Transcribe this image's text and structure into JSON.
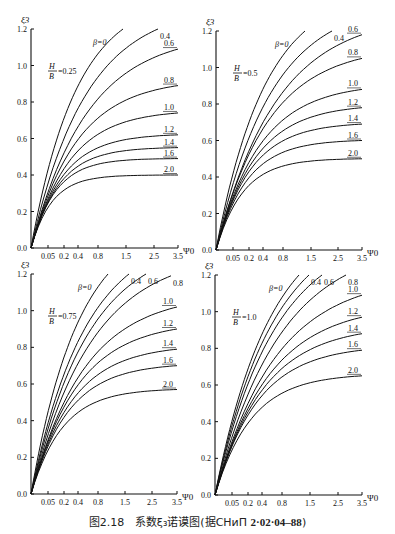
{
  "caption": {
    "figure_no": "图2.18",
    "title": "系数ξ₃诺谟图(据СНиП ",
    "code": "2·02·04–88",
    "close": ")"
  },
  "chart_data": [
    {
      "type": "line",
      "title": "H/B=0.25",
      "param_label": "H/B=0.25",
      "xlabel": "Ψ0",
      "ylabel": "ξ3",
      "ylim": [
        0,
        1.2
      ],
      "yticks": [
        0.0,
        0.2,
        0.4,
        0.6,
        0.8,
        1.0,
        1.2
      ],
      "xtick_labels": [
        "0.05",
        "0.2",
        "0.4",
        "0.8",
        "1.5",
        "2.5",
        "3.5"
      ],
      "box": {
        "x0": 31,
        "x1": 178,
        "y0": 248,
        "y1": 29
      },
      "xtick_px": [
        48,
        64,
        78,
        98,
        126,
        154,
        178
      ],
      "series": [
        {
          "name": "β=0",
          "label": "β=0",
          "end_x": 123,
          "end_y": 1.2,
          "k": 2.0
        },
        {
          "name": "0.4",
          "label": "0.4",
          "end_x": 158,
          "end_y": 1.2,
          "k": 2.3
        },
        {
          "name": "0.6",
          "label": "0.6",
          "end_x": 178,
          "end_y": 1.09,
          "k": 2.6
        },
        {
          "name": "0.8",
          "label": "0.8",
          "end_x": 178,
          "end_y": 0.89,
          "k": 3.2
        },
        {
          "name": "1.0",
          "label": "1.0",
          "end_x": 178,
          "end_y": 0.74,
          "k": 3.8
        },
        {
          "name": "1.2",
          "label": "1.2",
          "end_x": 178,
          "end_y": 0.62,
          "k": 4.6
        },
        {
          "name": "1.4",
          "label": "1.4",
          "end_x": 178,
          "end_y": 0.55,
          "k": 5.2
        },
        {
          "name": "1.6",
          "label": "1.6",
          "end_x": 178,
          "end_y": 0.49,
          "k": 6.0
        },
        {
          "name": "2.0",
          "label": "2.0",
          "end_x": 178,
          "end_y": 0.4,
          "k": 7.0
        }
      ]
    },
    {
      "type": "line",
      "title": "H/B=0.5",
      "param_label": "H/B=0.5",
      "xlabel": "Ψ0",
      "ylabel": "ξ3",
      "ylim": [
        0,
        1.2
      ],
      "yticks": [
        0.0,
        0.2,
        0.4,
        0.6,
        0.8,
        1.0,
        1.2
      ],
      "xtick_labels": [
        "0.05",
        "0.2",
        "0.4",
        "0.8",
        "1.5",
        "2.5",
        "3.5"
      ],
      "box": {
        "x0": 216,
        "x1": 362,
        "y0": 250,
        "y1": 31
      },
      "xtick_px": [
        233,
        249,
        263,
        283,
        311,
        338,
        362
      ],
      "series": [
        {
          "name": "β=0",
          "label": "β=0",
          "end_x": 305,
          "end_y": 1.2,
          "k": 1.8
        },
        {
          "name": "0.4",
          "label": "0.4",
          "end_x": 332,
          "end_y": 1.2,
          "k": 2.1
        },
        {
          "name": "0.6",
          "label": "0.6",
          "end_x": 362,
          "end_y": 1.18,
          "k": 2.4
        },
        {
          "name": "0.8",
          "label": "0.8",
          "end_x": 362,
          "end_y": 1.05,
          "k": 2.8
        },
        {
          "name": "1.0",
          "label": "1.0",
          "end_x": 362,
          "end_y": 0.88,
          "k": 3.3
        },
        {
          "name": "1.2",
          "label": "1.2",
          "end_x": 362,
          "end_y": 0.78,
          "k": 3.7
        },
        {
          "name": "1.4",
          "label": "1.4",
          "end_x": 362,
          "end_y": 0.69,
          "k": 4.2
        },
        {
          "name": "1.6",
          "label": "1.6",
          "end_x": 362,
          "end_y": 0.6,
          "k": 4.7
        },
        {
          "name": "2.0",
          "label": "2.0",
          "end_x": 362,
          "end_y": 0.5,
          "k": 5.4
        }
      ]
    },
    {
      "type": "line",
      "title": "H/B=0.75",
      "param_label": "H/B=0.75",
      "xlabel": "Ψ0",
      "ylabel": "ξ3",
      "ylim": [
        0,
        1.2
      ],
      "yticks": [
        0.0,
        0.2,
        0.4,
        0.6,
        0.8,
        1.0,
        1.2
      ],
      "xtick_labels": [
        "0.05",
        "0.2",
        "0.4",
        "0.8",
        "1.5",
        "2.5",
        "3.5"
      ],
      "box": {
        "x0": 31,
        "x1": 177,
        "y0": 494,
        "y1": 274
      },
      "xtick_px": [
        48,
        64,
        78,
        98,
        125,
        152,
        177
      ],
      "series": [
        {
          "name": "β=0",
          "label": "β=0",
          "end_x": 108,
          "end_y": 1.2,
          "k": 1.6
        },
        {
          "name": "0.4",
          "label": "0.4",
          "end_x": 129,
          "end_y": 1.2,
          "k": 1.8
        },
        {
          "name": "0.6",
          "label": "0.6",
          "end_x": 146,
          "end_y": 1.2,
          "k": 2.0
        },
        {
          "name": "0.8",
          "label": "0.8",
          "end_x": 171,
          "end_y": 1.19,
          "k": 2.3
        },
        {
          "name": "1.0",
          "label": "1.0",
          "end_x": 177,
          "end_y": 1.02,
          "k": 2.7
        },
        {
          "name": "1.2",
          "label": "1.2",
          "end_x": 177,
          "end_y": 0.9,
          "k": 3.1
        },
        {
          "name": "1.4",
          "label": "1.4",
          "end_x": 177,
          "end_y": 0.79,
          "k": 3.5
        },
        {
          "name": "1.6",
          "label": "1.6",
          "end_x": 177,
          "end_y": 0.7,
          "k": 3.9
        },
        {
          "name": "2.0",
          "label": "2.0",
          "end_x": 177,
          "end_y": 0.57,
          "k": 4.6
        }
      ]
    },
    {
      "type": "line",
      "title": "H/B=1.0",
      "param_label": "H/B=1.0",
      "xlabel": "Ψ0",
      "ylabel": "ξ3",
      "ylim": [
        0,
        1.2
      ],
      "yticks": [
        0.0,
        0.2,
        0.4,
        0.6,
        0.8,
        1.0,
        1.2
      ],
      "xtick_labels": [
        "0.05",
        "0.2",
        "0.4",
        "0.8",
        "1.5",
        "2.5",
        "3.5"
      ],
      "box": {
        "x0": 215,
        "x1": 362,
        "y0": 495,
        "y1": 275
      },
      "xtick_px": [
        232,
        248,
        262,
        282,
        310,
        338,
        362
      ],
      "series": [
        {
          "name": "β=0",
          "label": "β=0",
          "end_x": 299,
          "end_y": 1.2,
          "k": 1.5
        },
        {
          "name": "0.4",
          "label": "0.4",
          "end_x": 309,
          "end_y": 1.2,
          "k": 1.6
        },
        {
          "name": "0.6",
          "label": "0.6",
          "end_x": 322,
          "end_y": 1.2,
          "k": 1.75
        },
        {
          "name": "0.8",
          "label": "0.8",
          "end_x": 346,
          "end_y": 1.2,
          "k": 2.0
        },
        {
          "name": "1.0",
          "label": "1.0",
          "end_x": 362,
          "end_y": 1.09,
          "k": 2.4
        },
        {
          "name": "1.2",
          "label": "1.2",
          "end_x": 362,
          "end_y": 0.97,
          "k": 2.7
        },
        {
          "name": "1.4",
          "label": "1.4",
          "end_x": 362,
          "end_y": 0.88,
          "k": 3.0
        },
        {
          "name": "1.6",
          "label": "1.6",
          "end_x": 362,
          "end_y": 0.79,
          "k": 3.4
        },
        {
          "name": "2.0",
          "label": "2.0",
          "end_x": 362,
          "end_y": 0.65,
          "k": 4.0
        }
      ]
    }
  ]
}
